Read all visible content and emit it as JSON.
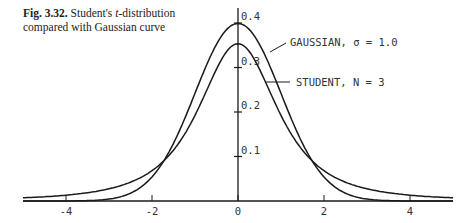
{
  "caption": {
    "fig_label": "Fig. 3.32.",
    "text_pre": " Student's ",
    "text_italic": "t",
    "text_post": "-distribution compared with Gaussian curve"
  },
  "chart_data": {
    "type": "line",
    "title": "Fig. 3.32. Student's t-distribution compared with Gaussian curve",
    "xlabel": "",
    "ylabel": "",
    "xlim": [
      -5,
      5
    ],
    "ylim": [
      0,
      0.4
    ],
    "x_ticks": [
      -4,
      -2,
      0,
      2,
      4
    ],
    "x_tick_labels": [
      "-4",
      "-2",
      "0",
      "2",
      "4"
    ],
    "y_ticks": [
      0.1,
      0.2,
      0.3,
      0.4
    ],
    "y_tick_labels": [
      "0.1",
      "0.2",
      "0.3",
      "0.4"
    ],
    "grid": false,
    "legend": "direct labels with leader lines, upper right",
    "x": [
      -5,
      -4,
      -3,
      -2,
      -1.5,
      -1,
      -0.5,
      0,
      0.5,
      1,
      1.5,
      2,
      3,
      4,
      5
    ],
    "series": [
      {
        "name": "GAUSSIAN, σ = 1.0",
        "values": [
          0.0,
          0.0001,
          0.0044,
          0.054,
          0.1295,
          0.242,
          0.3521,
          0.3989,
          0.3521,
          0.242,
          0.1295,
          0.054,
          0.0044,
          0.0001,
          0.0
        ]
      },
      {
        "name": "STUDENT, N = 3",
        "values": [
          0.0071,
          0.0113,
          0.022,
          0.068,
          0.1099,
          0.1925,
          0.2962,
          0.3536,
          0.2962,
          0.1925,
          0.1099,
          0.068,
          0.022,
          0.0113,
          0.0071
        ]
      }
    ]
  },
  "labels": {
    "gaussian": "GAUSSIAN, σ = 1.0",
    "student": "STUDENT, N = 3"
  },
  "style": {
    "line_color": "#1a1a1a",
    "text_color": "#333333"
  }
}
